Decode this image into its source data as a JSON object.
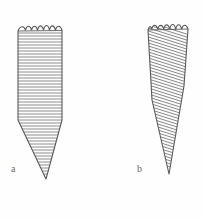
{
  "plate": {
    "title": "",
    "background_color": "#fefefe",
    "ink_color": "#5a5a5a",
    "hatch_color": "#6f6f6f",
    "width": 203,
    "height": 220
  },
  "figures": [
    {
      "id": "a",
      "label": "a",
      "label_position": {
        "x": 11,
        "y": 164
      },
      "description": "elongated tapering cone specimen with crenellated crown and horizontal internal hatching",
      "hatch_style": "horizontal",
      "hatch_angle_degrees": 0,
      "hatch_line_count": 44,
      "hatch_spacing_px": 3,
      "outline": {
        "top_y": 24,
        "left_x": 18,
        "right_x": 62,
        "shoulder_y": 120,
        "tip_x": 46,
        "tip_y": 179
      },
      "crown": {
        "type": "scalloped",
        "cusp_count": 5,
        "cusp_height_px": 7
      }
    },
    {
      "id": "b",
      "label": "b",
      "label_position": {
        "x": 137,
        "y": 164
      },
      "description": "elongated conical specimen with crenellated crown and oblique internal hatching",
      "hatch_style": "diagonal",
      "hatch_angle_degrees": 17,
      "hatch_line_count": 42,
      "hatch_spacing_px": 3,
      "outline": {
        "top_y": 23,
        "left_x": 148,
        "right_x": 188,
        "shoulder_y": 60,
        "tip_x": 169,
        "tip_y": 174
      },
      "crown": {
        "type": "scalloped",
        "cusp_count": 5,
        "cusp_height_px": 7
      }
    }
  ]
}
